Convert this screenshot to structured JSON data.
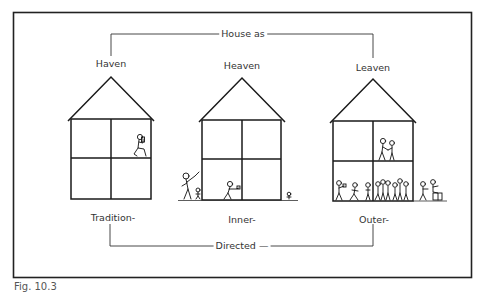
{
  "figure": {
    "caption": "Fig. 10.3",
    "top_bracket_label": "House as",
    "bottom_bracket_label": "Directed",
    "bottom_bracket_suffix": "—",
    "houses": [
      {
        "top_label": "Haven",
        "bottom_label": "Tradition-",
        "description": "single figure seated reading in upper-right room"
      },
      {
        "top_label": "Heaven",
        "bottom_label": "Inner-",
        "description": "figure in lower-left room, adult and child outside left, child outside right"
      },
      {
        "top_label": "Leaven",
        "bottom_label": "Outer-",
        "description": "couple upstairs, crowd downstairs, figures outside right"
      }
    ]
  },
  "colors": {
    "line": "#1a1a1a",
    "text": "#333333",
    "background": "#ffffff"
  }
}
